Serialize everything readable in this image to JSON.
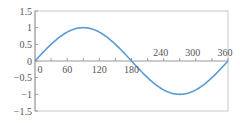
{
  "chart_data": {
    "type": "line",
    "title": "",
    "xlabel": "",
    "ylabel": "",
    "series": [
      {
        "name": "sin(x)",
        "color": "#5b9bd5",
        "x": [
          0,
          30,
          60,
          90,
          120,
          150,
          180,
          210,
          240,
          270,
          300,
          330,
          360
        ],
        "values": [
          0,
          0.5,
          0.866,
          1,
          0.866,
          0.5,
          0,
          -0.5,
          -0.866,
          -1,
          -0.866,
          -0.5,
          0
        ]
      }
    ],
    "xlim": [
      0,
      360
    ],
    "ylim": [
      -1.5,
      1.5
    ],
    "x_ticks": [
      "0",
      "60",
      "120",
      "180",
      "240",
      "300",
      "360"
    ],
    "y_ticks": [
      "1.5",
      "1",
      "0.5",
      "0",
      "-0.5",
      "-1",
      "-1.5"
    ],
    "grid": false,
    "legend": "none"
  },
  "axis": {
    "x_labels": [
      "0",
      "60",
      "120",
      "180",
      "240",
      "300",
      "360"
    ],
    "y_labels": [
      "1.5",
      "1",
      "0.5",
      "0",
      "-0.5",
      "-1",
      "-1.5"
    ]
  }
}
